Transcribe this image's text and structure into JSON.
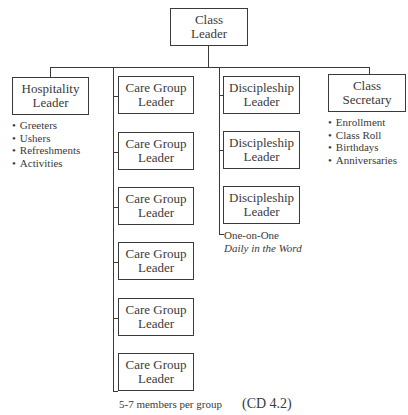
{
  "root": {
    "line1": "Class",
    "line2": "Leader"
  },
  "hospitality": {
    "line1": "Hospitality",
    "line2": "Leader",
    "items": [
      "Greeters",
      "Ushers",
      "Refreshments",
      "Activities"
    ]
  },
  "care_groups": {
    "boxes": [
      {
        "line1": "Care Group",
        "line2": "Leader"
      },
      {
        "line1": "Care Group",
        "line2": "Leader"
      },
      {
        "line1": "Care Group",
        "line2": "Leader"
      },
      {
        "line1": "Care Group",
        "line2": "Leader"
      },
      {
        "line1": "Care Group",
        "line2": "Leader"
      },
      {
        "line1": "Care Group",
        "line2": "Leader"
      }
    ],
    "note": "5-7 members per group"
  },
  "discipleship": {
    "boxes": [
      {
        "line1": "Discipleship",
        "line2": "Leader"
      },
      {
        "line1": "Discipleship",
        "line2": "Leader"
      },
      {
        "line1": "Discipleship",
        "line2": "Leader"
      }
    ],
    "note1": "One-on-One",
    "note2": "Daily in the Word"
  },
  "secretary": {
    "line1": "Class",
    "line2": "Secretary",
    "items": [
      "Enrollment",
      "Class Roll",
      "Birthdays",
      "Anniversaries"
    ]
  },
  "reference": "(CD 4.2)"
}
